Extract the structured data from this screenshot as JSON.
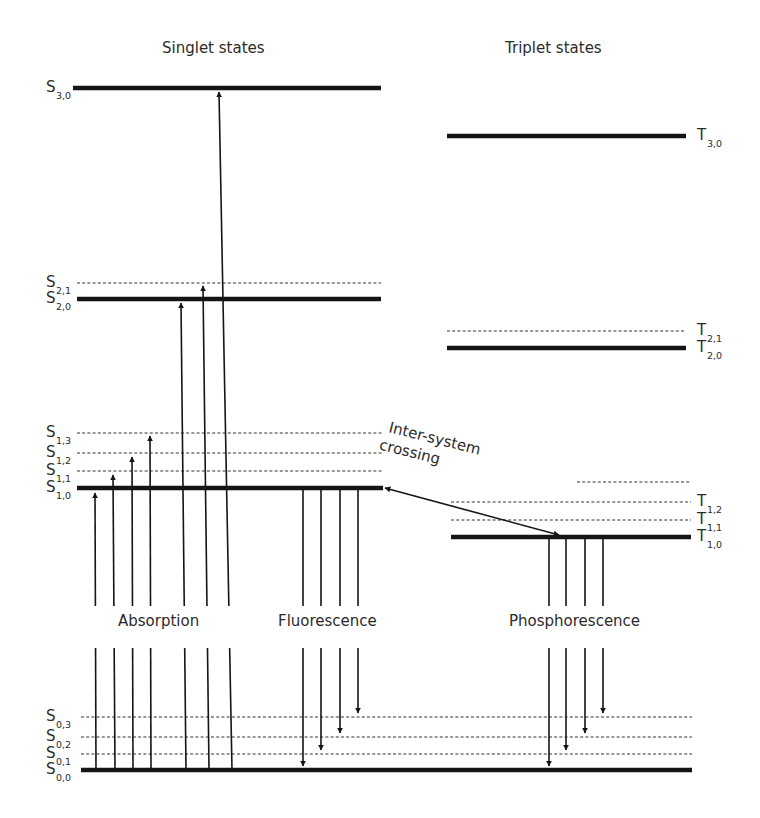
{
  "titles": {
    "singlet": "Singlet states",
    "triplet": "Triplet states"
  },
  "process_labels": {
    "absorption": "Absorption",
    "fluorescence": "Fluorescence",
    "phosphorescence": "Phosphorescence"
  },
  "isc_label": {
    "line1": "Inter-system",
    "line2": "crossing"
  },
  "singlet_levels": [
    {
      "main": "S",
      "sub": "3,0",
      "y": 88,
      "x1": 73,
      "x2": 381,
      "type": "thick"
    },
    {
      "main": "S",
      "sub": "2,1",
      "y": 283,
      "x1": 77,
      "x2": 381,
      "type": "dashed"
    },
    {
      "main": "S",
      "sub": "2,0",
      "y": 299,
      "x1": 77,
      "x2": 381,
      "type": "thick"
    },
    {
      "main": "S",
      "sub": "1,3",
      "y": 433,
      "x1": 77,
      "x2": 383,
      "type": "dashed"
    },
    {
      "main": "S",
      "sub": "1,2",
      "y": 453,
      "x1": 77,
      "x2": 383,
      "type": "dashed"
    },
    {
      "main": "S",
      "sub": "1,1",
      "y": 471,
      "x1": 77,
      "x2": 383,
      "type": "dashed"
    },
    {
      "main": "S",
      "sub": "1,0",
      "y": 488,
      "x1": 77,
      "x2": 383,
      "type": "thick"
    },
    {
      "main": "S",
      "sub": "0,3",
      "y": 717,
      "x1": 81,
      "x2": 692,
      "type": "dashed"
    },
    {
      "main": "S",
      "sub": "0,2",
      "y": 737,
      "x1": 81,
      "x2": 692,
      "type": "dashed"
    },
    {
      "main": "S",
      "sub": "0,1",
      "y": 754,
      "x1": 81,
      "x2": 692,
      "type": "dashed"
    },
    {
      "main": "S",
      "sub": "0,0",
      "y": 770,
      "x1": 81,
      "x2": 692,
      "type": "thick"
    }
  ],
  "triplet_levels": [
    {
      "main": "T",
      "sub": "3,0",
      "y": 136,
      "x1": 447,
      "x2": 686,
      "type": "thick"
    },
    {
      "main": "T",
      "sub": "2,1",
      "y": 331,
      "x1": 447,
      "x2": 686,
      "type": "dashed"
    },
    {
      "main": "T",
      "sub": "2,0",
      "y": 348,
      "x1": 447,
      "x2": 686,
      "type": "thick"
    },
    {
      "main": "T",
      "sub": "",
      "y": 482,
      "x1": 577,
      "x2": 691,
      "type": "dashed"
    },
    {
      "main": "T",
      "sub": "1,2",
      "y": 502,
      "x1": 451,
      "x2": 691,
      "type": "dashed"
    },
    {
      "main": "T",
      "sub": "1,1",
      "y": 520,
      "x1": 451,
      "x2": 691,
      "type": "dashed"
    },
    {
      "main": "T",
      "sub": "1,0",
      "y": 537,
      "x1": 451,
      "x2": 691,
      "type": "thick"
    }
  ],
  "absorption_arrows": [
    {
      "x_bottom": 96,
      "x_top": 95,
      "y_top": 493
    },
    {
      "x_bottom": 115,
      "x_top": 113,
      "y_top": 475
    },
    {
      "x_bottom": 133,
      "x_top": 132,
      "y_top": 457
    },
    {
      "x_bottom": 151,
      "x_top": 150,
      "y_top": 436
    },
    {
      "x_bottom": 186,
      "x_top": 181,
      "y_top": 303
    },
    {
      "x_bottom": 209,
      "x_top": 203,
      "y_top": 286
    },
    {
      "x_bottom": 232,
      "x_top": 219,
      "y_top": 92
    }
  ],
  "fluorescence_arrows": [
    {
      "x": 303,
      "y_bottom": 766
    },
    {
      "x": 321,
      "y_bottom": 750
    },
    {
      "x": 340,
      "y_bottom": 733
    },
    {
      "x": 358,
      "y_bottom": 713
    }
  ],
  "phosphorescence_arrows": [
    {
      "x": 549,
      "y_bottom": 766
    },
    {
      "x": 566,
      "y_bottom": 750
    },
    {
      "x": 585,
      "y_bottom": 733
    },
    {
      "x": 603,
      "y_bottom": 713
    }
  ],
  "isc_arrow": {
    "x1": 385,
    "y1": 488,
    "x2": 559,
    "y2": 535
  }
}
